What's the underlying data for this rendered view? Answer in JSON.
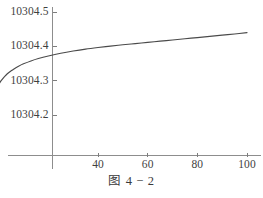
{
  "figure": {
    "caption": "图 4 − 2",
    "background_color": "#ffffff",
    "curve_color": "#4a4a4a",
    "axis_color": "#8a8a8a",
    "text_color": "#3b3b3b"
  },
  "chart_data": {
    "type": "line",
    "title": "",
    "subtitle": "",
    "xlabel": "",
    "ylabel": "",
    "grid": false,
    "legend": false,
    "legend_position": "none",
    "xlim": [
      -5,
      105
    ],
    "ylim": [
      10304.13,
      10304.54
    ],
    "xticks": [
      40,
      60,
      80,
      100
    ],
    "xtick_labels": [
      "40",
      "60",
      "80",
      "100"
    ],
    "yticks": [
      10304.2,
      10304.3,
      10304.4,
      10304.5
    ],
    "ytick_labels": [
      "10304.2",
      "10304.3",
      "10304.4",
      "10304.5"
    ],
    "axis_origin_x": -4,
    "axis_origin_y": 10304.145,
    "series": [
      {
        "name": "curve",
        "x": [
          -4.4,
          -4.0,
          -3.5,
          -3.0,
          -2.5,
          -2.0,
          -1.0,
          0.0,
          1.0,
          2.0,
          3.0,
          4.0,
          5.0,
          6.0,
          8.0,
          10.0,
          13.0,
          16.0,
          20.0,
          25.0,
          30.0,
          35.0,
          40.0,
          45.0,
          50.0,
          55.0,
          60.0,
          65.0,
          70.0,
          75.0,
          80.0,
          85.0,
          90.0,
          95.0,
          100.0
        ],
        "y": [
          10304.14,
          10304.17,
          10304.201,
          10304.224,
          10304.241,
          10304.254,
          10304.274,
          10304.2885,
          10304.3,
          10304.309,
          10304.3165,
          10304.323,
          10304.3285,
          10304.3335,
          10304.342,
          10304.349,
          10304.3575,
          10304.3645,
          10304.372,
          10304.38,
          10304.3865,
          10304.392,
          10304.3965,
          10304.4005,
          10304.4045,
          10304.408,
          10304.4115,
          10304.415,
          10304.4185,
          10304.422,
          10304.4255,
          10304.429,
          10304.4325,
          10304.436,
          10304.44
        ]
      }
    ]
  }
}
